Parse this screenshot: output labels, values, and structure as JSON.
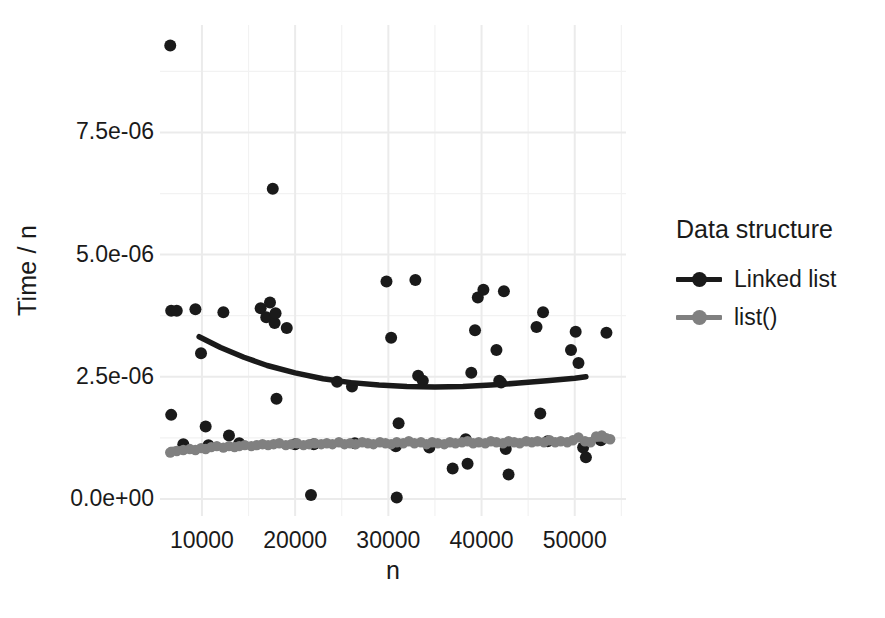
{
  "chart_data": {
    "type": "scatter",
    "title": "",
    "xlabel": "n",
    "ylabel": "Time / n",
    "xlim": [
      5500,
      55500
    ],
    "ylim": [
      -3.5e-07,
      9.7e-06
    ],
    "grid": true,
    "legend": {
      "title": "Data structure",
      "position": "right",
      "entries": [
        {
          "name": "Linked list",
          "color": "#1a1a1a"
        },
        {
          "name": "list()",
          "color": "#808080"
        }
      ]
    },
    "xticks": [
      {
        "value": 10000,
        "label": "10000"
      },
      {
        "value": 20000,
        "label": "20000"
      },
      {
        "value": 30000,
        "label": "30000"
      },
      {
        "value": 40000,
        "label": "40000"
      },
      {
        "value": 50000,
        "label": "50000"
      }
    ],
    "yticks": [
      {
        "value": 0.0,
        "label": "0.0e+00"
      },
      {
        "value": 2.5e-06,
        "label": "2.5e-06"
      },
      {
        "value": 5e-06,
        "label": "5.0e-06"
      },
      {
        "value": 7.5e-06,
        "label": "7.5e-06"
      }
    ],
    "series": [
      {
        "name": "Linked list",
        "color": "#1a1a1a",
        "points": [
          [
            6600,
            9.28e-06
          ],
          [
            6700,
            3.85e-06
          ],
          [
            7300,
            3.85e-06
          ],
          [
            6700,
            1.72e-06
          ],
          [
            8000,
            1.12e-06
          ],
          [
            9300,
            3.88e-06
          ],
          [
            9900,
            2.98e-06
          ],
          [
            10400,
            1.48e-06
          ],
          [
            10700,
            1.1e-06
          ],
          [
            12300,
            3.82e-06
          ],
          [
            12900,
            1.3e-06
          ],
          [
            14000,
            1.14e-06
          ],
          [
            16300,
            3.9e-06
          ],
          [
            16900,
            3.72e-06
          ],
          [
            17300,
            4.02e-06
          ],
          [
            17600,
            6.35e-06
          ],
          [
            17800,
            3.6e-06
          ],
          [
            17900,
            3.8e-06
          ],
          [
            18000,
            2.05e-06
          ],
          [
            19100,
            3.5e-06
          ],
          [
            20000,
            1.12e-06
          ],
          [
            21700,
            8e-08
          ],
          [
            22000,
            1.12e-06
          ],
          [
            24500,
            2.4e-06
          ],
          [
            26100,
            2.3e-06
          ],
          [
            26400,
            1.14e-06
          ],
          [
            29800,
            4.45e-06
          ],
          [
            30300,
            3.3e-06
          ],
          [
            30800,
            1.08e-06
          ],
          [
            30900,
            3e-08
          ],
          [
            31100,
            1.55e-06
          ],
          [
            32900,
            4.48e-06
          ],
          [
            33200,
            2.52e-06
          ],
          [
            33700,
            2.42e-06
          ],
          [
            34400,
            1.05e-06
          ],
          [
            36900,
            6.2e-07
          ],
          [
            38300,
            1.22e-06
          ],
          [
            38500,
            7.2e-07
          ],
          [
            38900,
            2.58e-06
          ],
          [
            39300,
            3.45e-06
          ],
          [
            39600,
            4.12e-06
          ],
          [
            40200,
            4.28e-06
          ],
          [
            41600,
            3.05e-06
          ],
          [
            41900,
            2.42e-06
          ],
          [
            42100,
            2.38e-06
          ],
          [
            42400,
            4.25e-06
          ],
          [
            42600,
            1.02e-06
          ],
          [
            42900,
            5e-07
          ],
          [
            45900,
            3.52e-06
          ],
          [
            46300,
            1.75e-06
          ],
          [
            46600,
            3.82e-06
          ],
          [
            47100,
            1.18e-06
          ],
          [
            49600,
            3.05e-06
          ],
          [
            50100,
            3.42e-06
          ],
          [
            50400,
            2.78e-06
          ],
          [
            50900,
            1.05e-06
          ],
          [
            51200,
            8.5e-07
          ],
          [
            52800,
            1.2e-06
          ],
          [
            53400,
            3.4e-06
          ]
        ],
        "trend": [
          [
            9700,
            3.32e-06
          ],
          [
            12000,
            3.1e-06
          ],
          [
            14500,
            2.9e-06
          ],
          [
            17000,
            2.73e-06
          ],
          [
            20000,
            2.58e-06
          ],
          [
            23000,
            2.46e-06
          ],
          [
            26000,
            2.38e-06
          ],
          [
            29000,
            2.33e-06
          ],
          [
            32000,
            2.3e-06
          ],
          [
            35000,
            2.29e-06
          ],
          [
            38000,
            2.3e-06
          ],
          [
            41000,
            2.33e-06
          ],
          [
            44000,
            2.37e-06
          ],
          [
            47000,
            2.42e-06
          ],
          [
            50000,
            2.47e-06
          ],
          [
            51200,
            2.5e-06
          ]
        ]
      },
      {
        "name": "list()",
        "color": "#808080",
        "points": [
          [
            6600,
            9.5e-07
          ],
          [
            7300,
            9.8e-07
          ],
          [
            8000,
            1e-06
          ],
          [
            8700,
            1.02e-06
          ],
          [
            9300,
            1e-06
          ],
          [
            9900,
            1.04e-06
          ],
          [
            10400,
            1.02e-06
          ],
          [
            11000,
            1.06e-06
          ],
          [
            11600,
            1.08e-06
          ],
          [
            12300,
            1.05e-06
          ],
          [
            12900,
            1.08e-06
          ],
          [
            13500,
            1.06e-06
          ],
          [
            14000,
            1.08e-06
          ],
          [
            14600,
            1.1e-06
          ],
          [
            15300,
            1.08e-06
          ],
          [
            15900,
            1.1e-06
          ],
          [
            16500,
            1.12e-06
          ],
          [
            17100,
            1.1e-06
          ],
          [
            17700,
            1.12e-06
          ],
          [
            18300,
            1.14e-06
          ],
          [
            19000,
            1.1e-06
          ],
          [
            19600,
            1.12e-06
          ],
          [
            20200,
            1.14e-06
          ],
          [
            20900,
            1.1e-06
          ],
          [
            21500,
            1.12e-06
          ],
          [
            22100,
            1.14e-06
          ],
          [
            22800,
            1.12e-06
          ],
          [
            23400,
            1.14e-06
          ],
          [
            24000,
            1.12e-06
          ],
          [
            24700,
            1.16e-06
          ],
          [
            25300,
            1.12e-06
          ],
          [
            25900,
            1.14e-06
          ],
          [
            26500,
            1.12e-06
          ],
          [
            27200,
            1.16e-06
          ],
          [
            27800,
            1.14e-06
          ],
          [
            28400,
            1.12e-06
          ],
          [
            29100,
            1.16e-06
          ],
          [
            29700,
            1.14e-06
          ],
          [
            30300,
            1.12e-06
          ],
          [
            30900,
            1.16e-06
          ],
          [
            31600,
            1.14e-06
          ],
          [
            32200,
            1.18e-06
          ],
          [
            32800,
            1.14e-06
          ],
          [
            33500,
            1.16e-06
          ],
          [
            34100,
            1.12e-06
          ],
          [
            34700,
            1.16e-06
          ],
          [
            35300,
            1.14e-06
          ],
          [
            36000,
            1.12e-06
          ],
          [
            36600,
            1.16e-06
          ],
          [
            37200,
            1.14e-06
          ],
          [
            37900,
            1.16e-06
          ],
          [
            38500,
            1.18e-06
          ],
          [
            39100,
            1.14e-06
          ],
          [
            39700,
            1.16e-06
          ],
          [
            40400,
            1.14e-06
          ],
          [
            41000,
            1.18e-06
          ],
          [
            41600,
            1.16e-06
          ],
          [
            42300,
            1.14e-06
          ],
          [
            42900,
            1.18e-06
          ],
          [
            43500,
            1.16e-06
          ],
          [
            44100,
            1.14e-06
          ],
          [
            44800,
            1.18e-06
          ],
          [
            45400,
            1.16e-06
          ],
          [
            46000,
            1.18e-06
          ],
          [
            46700,
            1.16e-06
          ],
          [
            47300,
            1.2e-06
          ],
          [
            47900,
            1.16e-06
          ],
          [
            48500,
            1.18e-06
          ],
          [
            49200,
            1.16e-06
          ],
          [
            49800,
            1.2e-06
          ],
          [
            50400,
            1.26e-06
          ],
          [
            51100,
            1.18e-06
          ],
          [
            51700,
            1.16e-06
          ],
          [
            52300,
            1.28e-06
          ],
          [
            52900,
            1.3e-06
          ],
          [
            53400,
            1.24e-06
          ],
          [
            53800,
            1.22e-06
          ]
        ],
        "trend": [
          [
            6600,
            1.02e-06
          ],
          [
            12000,
            1.06e-06
          ],
          [
            18000,
            1.09e-06
          ],
          [
            24000,
            1.12e-06
          ],
          [
            30000,
            1.14e-06
          ],
          [
            36000,
            1.16e-06
          ],
          [
            42000,
            1.18e-06
          ],
          [
            48000,
            1.2e-06
          ],
          [
            53800,
            1.22e-06
          ]
        ]
      }
    ]
  }
}
